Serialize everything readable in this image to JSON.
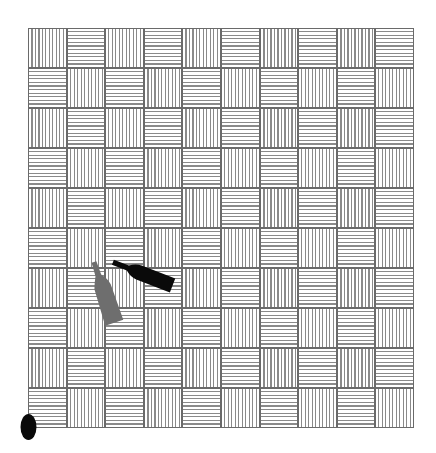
{
  "scene": {
    "board": {
      "columns": 10,
      "rows": 10,
      "pattern": "alternating vertical/horizontal hatched squares (basketweave)",
      "top_left_cell": "vertical",
      "line_color": "#8a8a8a",
      "border_color": "#6a6a6a",
      "background_color": "#ffffff"
    },
    "objects": [
      {
        "name": "black-bottle",
        "color": "#0a0a0a",
        "orientation": "lying, neck pointing up-left"
      },
      {
        "name": "gray-bottle",
        "color": "#6e6e6e",
        "orientation": "lying, neck pointing up"
      },
      {
        "name": "black-oval",
        "color": "#0a0a0a",
        "position": "bottom-left corner"
      }
    ]
  }
}
